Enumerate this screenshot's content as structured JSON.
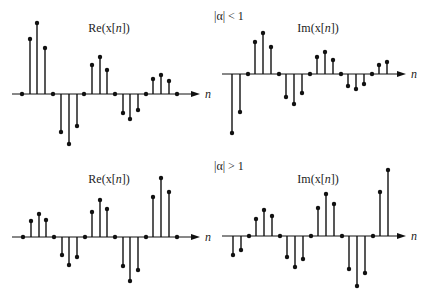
{
  "chart_data": [
    {
      "type": "stem",
      "title": "Re(x[n])",
      "condition": "|α| < 1",
      "xlabel": "n",
      "axis_y": 94,
      "x_start": 12,
      "x_end": 200,
      "label_pos": [
        109,
        32
      ],
      "x": [
        22,
        30,
        37,
        45,
        53,
        61,
        69,
        77,
        84,
        92,
        100,
        107,
        115,
        123,
        130,
        138,
        146,
        153,
        161,
        169,
        177
      ],
      "values": [
        0,
        0.56,
        0.72,
        0.47,
        0,
        -0.39,
        -0.51,
        -0.33,
        0,
        0.3,
        0.38,
        0.24,
        0,
        -0.16,
        -0.22,
        -0.14,
        0,
        0.12,
        0.16,
        0.11,
        0
      ],
      "py": [
        94,
        39,
        23,
        48,
        94,
        132,
        144,
        126,
        94,
        65,
        57,
        70,
        94,
        113,
        119,
        110,
        94,
        79,
        75,
        81,
        94
      ]
    },
    {
      "type": "stem",
      "title": "Im(x[n])",
      "xlabel": "n",
      "axis_y": 74,
      "x_start": 222,
      "x_end": 406,
      "label_pos": [
        318,
        32
      ],
      "x": [
        232,
        240,
        248,
        255,
        263,
        271,
        279,
        286,
        294,
        302,
        310,
        317,
        325,
        333,
        341,
        348,
        356,
        364,
        372,
        379,
        387
      ],
      "values": [
        -0.6,
        -0.39,
        0,
        0.32,
        0.41,
        0.27,
        0,
        -0.23,
        -0.3,
        -0.19,
        0,
        0.17,
        0.22,
        0.14,
        0,
        -0.12,
        -0.15,
        -0.1,
        0,
        0.09,
        0.12
      ],
      "py": [
        133,
        112,
        74,
        42,
        33,
        47,
        74,
        97,
        104,
        93,
        74,
        57,
        52,
        60,
        74,
        86,
        89,
        84,
        74,
        65,
        62
      ]
    },
    {
      "type": "stem",
      "title": "Re(x[n])",
      "condition": "|α| > 1",
      "xlabel": "n",
      "axis_y": 237,
      "x_start": 12,
      "x_end": 200,
      "label_pos": [
        109,
        183
      ],
      "x": [
        23,
        31,
        39,
        46,
        54,
        62,
        69,
        77,
        85,
        92,
        100,
        107,
        115,
        123,
        130,
        138,
        146,
        153,
        161,
        169,
        177
      ],
      "values": [
        0,
        0.16,
        0.23,
        0.17,
        0,
        -0.18,
        -0.28,
        -0.2,
        0,
        0.25,
        0.37,
        0.28,
        0,
        -0.29,
        -0.44,
        -0.33,
        0,
        0.4,
        0.59,
        0.45,
        0
      ],
      "py": [
        237,
        221,
        214,
        220,
        237,
        255,
        265,
        257,
        237,
        212,
        200,
        209,
        237,
        266,
        281,
        270,
        237,
        197,
        178,
        192,
        237
      ]
    },
    {
      "type": "stem",
      "title": "Im(x[n])",
      "xlabel": "n",
      "axis_y": 236,
      "x_start": 222,
      "x_end": 406,
      "label_pos": [
        318,
        183
      ],
      "x": [
        233,
        241,
        249,
        256,
        264,
        272,
        280,
        287,
        295,
        303,
        311,
        318,
        326,
        334,
        342,
        349,
        357,
        365,
        373,
        380,
        388
      ],
      "values": [
        -0.19,
        -0.14,
        0,
        0.17,
        0.26,
        0.2,
        0,
        -0.21,
        -0.31,
        -0.23,
        0,
        0.28,
        0.42,
        0.32,
        0,
        -0.33,
        -0.5,
        -0.37,
        0,
        0.44,
        0.66
      ],
      "py": [
        255,
        250,
        236,
        219,
        210,
        216,
        236,
        257,
        267,
        259,
        236,
        208,
        194,
        204,
        236,
        269,
        286,
        273,
        236,
        192,
        170
      ]
    }
  ],
  "conditions": [
    {
      "text": "|α| < 1",
      "pos": [
        214,
        20
      ]
    },
    {
      "text": "|α| > 1",
      "pos": [
        214,
        170
      ]
    }
  ],
  "colors": {
    "stem": "#111111",
    "axis": "#111111"
  }
}
